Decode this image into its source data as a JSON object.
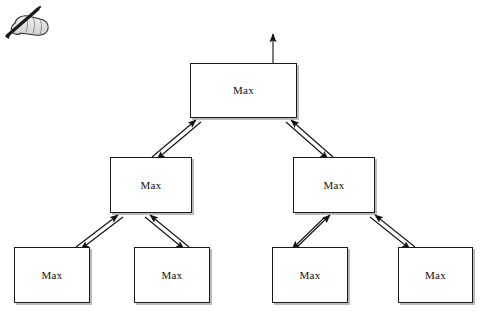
{
  "canvas": {
    "width": 483,
    "height": 318,
    "background": "#ffffff",
    "line_color": "#1a1a1a",
    "box_fill": "#ffffff",
    "shadow_color": "#828282"
  },
  "decoration": {
    "hand_pen_icon": "hand-with-pen-icon",
    "hand_pen_alt": "hand holding a pen"
  },
  "diagram": {
    "type": "binary-tree",
    "title": "",
    "node_label": "Max",
    "levels": 3,
    "node_count": 7,
    "edge_style": "bidirectional-double-line-arrow",
    "root_output_arrow": true,
    "nodes": [
      {
        "id": "root",
        "label": "Max",
        "level": 0,
        "x": 190,
        "y": 63,
        "w": 107,
        "h": 55
      },
      {
        "id": "mid-left",
        "label": "Max",
        "level": 1,
        "x": 110,
        "y": 157,
        "w": 82,
        "h": 56
      },
      {
        "id": "mid-right",
        "label": "Max",
        "level": 1,
        "x": 293,
        "y": 157,
        "w": 82,
        "h": 56
      },
      {
        "id": "leaf-1",
        "label": "Max",
        "level": 2,
        "x": 14,
        "y": 247,
        "w": 76,
        "h": 56
      },
      {
        "id": "leaf-2",
        "label": "Max",
        "level": 2,
        "x": 134,
        "y": 247,
        "w": 76,
        "h": 56
      },
      {
        "id": "leaf-3",
        "label": "Max",
        "level": 2,
        "x": 272,
        "y": 247,
        "w": 76,
        "h": 56
      },
      {
        "id": "leaf-4",
        "label": "Max",
        "level": 2,
        "x": 398,
        "y": 247,
        "w": 75,
        "h": 56
      }
    ],
    "edges": [
      {
        "id": "root-midleft",
        "from": "mid-left",
        "to": "root",
        "bidirectional": true
      },
      {
        "id": "root-midright",
        "from": "mid-right",
        "to": "root",
        "bidirectional": true
      },
      {
        "id": "midleft-leaf1",
        "from": "leaf-1",
        "to": "mid-left",
        "bidirectional": true
      },
      {
        "id": "midleft-leaf2",
        "from": "leaf-2",
        "to": "mid-left",
        "bidirectional": true
      },
      {
        "id": "midright-leaf3",
        "from": "leaf-3",
        "to": "mid-right",
        "bidirectional": true
      },
      {
        "id": "midright-leaf4",
        "from": "leaf-4",
        "to": "mid-right",
        "bidirectional": true
      }
    ],
    "output_arrow": {
      "id": "root-output",
      "from_x": 273,
      "from_y": 63,
      "to_x": 273,
      "to_y": 33
    }
  }
}
